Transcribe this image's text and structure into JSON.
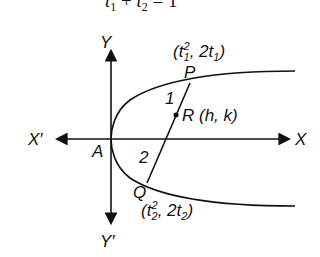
{
  "diagram": {
    "equation": {
      "text_main": "t",
      "sub1": "1",
      "plus": " + ",
      "sub2": "2",
      "rhs": " = 1"
    },
    "axes": {
      "x_positive": "X",
      "x_negative": "X′",
      "y_positive": "Y",
      "y_negative": "Y′",
      "origin": "A"
    },
    "curve": "parabola y² = 4ax (opening right, vertex at A)",
    "points": {
      "P": {
        "label": "P",
        "coord_t": "t",
        "coord_sub": "1",
        "coord_sup": "2",
        "coord_y": "2t",
        "coord_y_sub": "1"
      },
      "Q": {
        "label": "Q",
        "coord_t": "t",
        "coord_sub": "2",
        "coord_sup": "2",
        "coord_y": "2t",
        "coord_y_sub": "2"
      },
      "R": {
        "label": "R (h, k)"
      }
    },
    "ratio": {
      "PR": "1",
      "RQ": "2"
    },
    "colors": {
      "stroke": "#111111",
      "background": "#ffffff"
    }
  }
}
